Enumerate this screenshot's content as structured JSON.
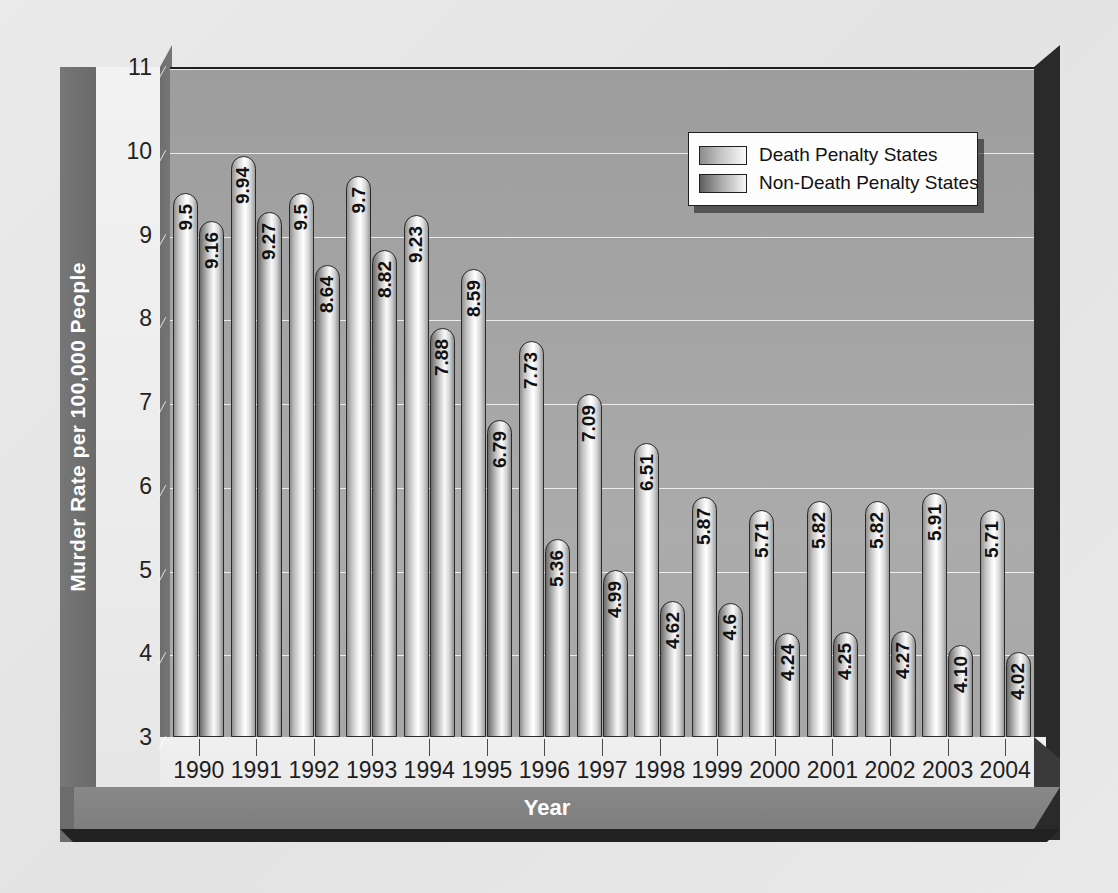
{
  "chart_data": {
    "type": "bar",
    "title": "",
    "xlabel": "Year",
    "ylabel": "Murder  Rate per 100,000 People",
    "ylim": [
      3,
      11
    ],
    "yticks": [
      3,
      4,
      5,
      6,
      7,
      8,
      9,
      10,
      11
    ],
    "grid": true,
    "legend_position": "top-right",
    "categories": [
      "1990",
      "1991",
      "1992",
      "1993",
      "1994",
      "1995",
      "1996",
      "1997",
      "1998",
      "1999",
      "2000",
      "2001",
      "2002",
      "2003",
      "2004"
    ],
    "series": [
      {
        "name": "Death Penalty States",
        "values": [
          9.5,
          9.94,
          9.5,
          9.7,
          9.23,
          8.59,
          7.73,
          7.09,
          6.51,
          5.87,
          5.71,
          5.82,
          5.82,
          5.91,
          5.71
        ],
        "labels": [
          "9.5",
          "9.94",
          "9.5",
          "9.7",
          "9.23",
          "8.59",
          "7.73",
          "7.09",
          "6.51",
          "5.87",
          "5.71",
          "5.82",
          "5.82",
          "5.91",
          "5.71"
        ]
      },
      {
        "name": "Non-Death Penalty States",
        "values": [
          9.16,
          9.27,
          8.64,
          8.82,
          7.88,
          6.79,
          5.36,
          4.99,
          4.62,
          4.6,
          4.24,
          4.25,
          4.27,
          4.1,
          4.02
        ],
        "labels": [
          "9.16",
          "9.27",
          "8.64",
          "8.82",
          "7.88",
          "6.79",
          "5.36",
          "4.99",
          "4.62",
          "4.6",
          "4.24",
          "4.25",
          "4.27",
          "4.10",
          "4.02"
        ]
      }
    ]
  },
  "legend": {
    "entries": [
      {
        "label": "Death Penalty States",
        "swatch": "dp"
      },
      {
        "label": "Non-Death Penalty States",
        "swatch": "ndp"
      }
    ]
  },
  "colors": {
    "plot_background": "#a4a4a4",
    "gridline": "#ffffff",
    "axis_band": "#6f6f6f",
    "tick_column": "#ececec",
    "base_front": "#212121",
    "bar_outline": "#2b2b2b",
    "page_background": "#e8e8e8"
  }
}
